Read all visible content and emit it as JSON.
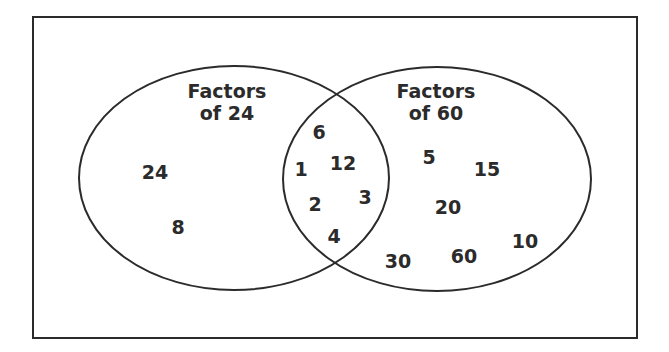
{
  "diagram": {
    "type": "venn",
    "sets": [
      {
        "id": "left",
        "title_line1": "Factors",
        "title_line2": "of 24"
      },
      {
        "id": "right",
        "title_line1": "Factors",
        "title_line2": "of 60"
      }
    ],
    "only_left": [
      "24",
      "8"
    ],
    "intersection": [
      "6",
      "1",
      "12",
      "3",
      "2",
      "4"
    ],
    "only_right": [
      "5",
      "15",
      "20",
      "10",
      "30",
      "60"
    ],
    "colors": {
      "stroke": "#2b2b2b",
      "text": "#2b2b2b",
      "background": "#ffffff"
    }
  },
  "labels": {
    "left_title_1": "Factors",
    "left_title_2": "of 24",
    "right_title_1": "Factors",
    "right_title_2": "of 60",
    "n24": "24",
    "n8": "8",
    "n6": "6",
    "n1": "1",
    "n12": "12",
    "n3": "3",
    "n2": "2",
    "n4": "4",
    "n5": "5",
    "n15": "15",
    "n20": "20",
    "n10": "10",
    "n30": "30",
    "n60": "60"
  }
}
